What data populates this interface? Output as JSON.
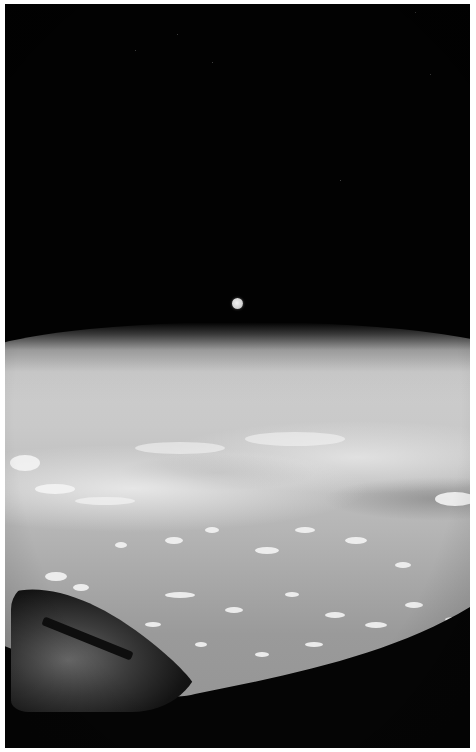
{
  "image": {
    "subject": "Earth horizon from orbit with the Moon above, viewed through a spacecraft window",
    "colors": {
      "space": "#020202",
      "atmosphere_glow": "#8a8a8a",
      "cloud_tops": "#f4f4f4",
      "ocean_surface": "#9a9a9a",
      "window_frame": "#050505",
      "border": "#ffffff"
    },
    "elements": [
      {
        "name": "space",
        "description": "black sky"
      },
      {
        "name": "moon",
        "description": "small full moon above horizon"
      },
      {
        "name": "earth-horizon",
        "description": "curved limb with atmospheric haze"
      },
      {
        "name": "cloud-field",
        "description": "scattered cumulus clouds over ocean"
      },
      {
        "name": "spacecraft-nose",
        "description": "dark hull section in lower-left"
      },
      {
        "name": "window-frame",
        "description": "dark frame edge across bottom"
      }
    ]
  }
}
